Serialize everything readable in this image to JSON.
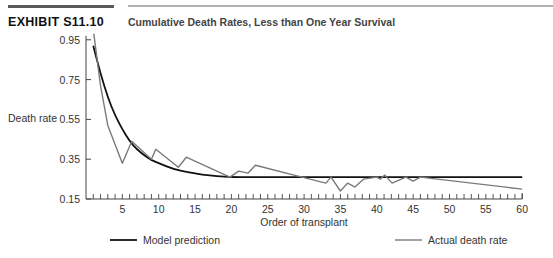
{
  "header": {
    "exhibit_label": "EXHIBIT S11.10",
    "title": "Cumulative Death Rates, Less than One Year Survival"
  },
  "chart_data": {
    "type": "line",
    "title": "Cumulative Death Rates, Less than One Year Survival",
    "xlabel": "Order of transplant",
    "ylabel": "Death rate",
    "xlim": [
      0,
      60
    ],
    "ylim": [
      0.15,
      0.95
    ],
    "x_ticks": [
      5,
      10,
      15,
      20,
      25,
      30,
      35,
      40,
      45,
      50,
      55,
      60
    ],
    "y_ticks": [
      0.15,
      0.35,
      0.55,
      0.75,
      0.95
    ],
    "y_tick_labels": [
      "0.15",
      "0.35",
      "0.55",
      "0.75",
      "0.95"
    ],
    "grid": false,
    "legend_position": "bottom",
    "series": [
      {
        "name": "Model prediction",
        "color": "#111111",
        "points": [
          [
            1,
            0.92
          ],
          [
            2,
            0.78
          ],
          [
            3,
            0.66
          ],
          [
            4,
            0.57
          ],
          [
            5,
            0.5
          ],
          [
            6,
            0.44
          ],
          [
            7,
            0.4
          ],
          [
            8,
            0.37
          ],
          [
            9,
            0.345
          ],
          [
            10,
            0.33
          ],
          [
            12,
            0.3
          ],
          [
            14,
            0.285
          ],
          [
            16,
            0.272
          ],
          [
            18,
            0.265
          ],
          [
            20,
            0.26
          ],
          [
            25,
            0.26
          ],
          [
            30,
            0.26
          ],
          [
            35,
            0.26
          ],
          [
            40,
            0.26
          ],
          [
            45,
            0.26
          ],
          [
            50,
            0.26
          ],
          [
            55,
            0.26
          ],
          [
            60,
            0.26
          ]
        ]
      },
      {
        "name": "Actual death rate",
        "color": "#7a7a7a",
        "points": [
          [
            1,
            1.0
          ],
          [
            2,
            0.72
          ],
          [
            3,
            0.52
          ],
          [
            5,
            0.33
          ],
          [
            6.3,
            0.44
          ],
          [
            9,
            0.35
          ],
          [
            9.6,
            0.4
          ],
          [
            12.7,
            0.31
          ],
          [
            13.8,
            0.36
          ],
          [
            19.8,
            0.26
          ],
          [
            21,
            0.29
          ],
          [
            22.3,
            0.28
          ],
          [
            23.3,
            0.32
          ],
          [
            29.7,
            0.26
          ],
          [
            33,
            0.23
          ],
          [
            33.7,
            0.26
          ],
          [
            35,
            0.19
          ],
          [
            36,
            0.23
          ],
          [
            37,
            0.21
          ],
          [
            38.2,
            0.25
          ],
          [
            40,
            0.26
          ],
          [
            40.5,
            0.25
          ],
          [
            41.1,
            0.27
          ],
          [
            42.1,
            0.23
          ],
          [
            44,
            0.26
          ],
          [
            45,
            0.24
          ],
          [
            46,
            0.26
          ],
          [
            60,
            0.2
          ]
        ]
      }
    ]
  },
  "legend": {
    "model_label": "Model prediction",
    "actual_label": "Actual death rate"
  }
}
